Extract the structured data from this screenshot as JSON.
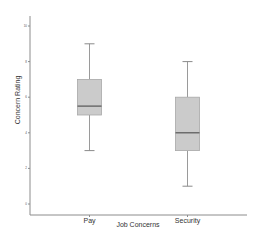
{
  "chart_data": {
    "type": "boxplot",
    "title": "",
    "xlabel": "Job Concerns",
    "ylabel": "Concern Rating",
    "ylim": [
      -0.7,
      10.6
    ],
    "yticks": [
      0,
      2,
      4,
      6,
      8,
      10
    ],
    "ytick_labels": [
      "0",
      "2",
      "4",
      "6",
      "8",
      "10"
    ],
    "grid": false,
    "legend": "none",
    "categories": [
      "Pay",
      "Security"
    ],
    "series": [
      {
        "name": "Pay",
        "whisker_low": 3.0,
        "q1": 5.0,
        "median": 5.5,
        "q3": 7.0,
        "whisker_high": 9.0
      },
      {
        "name": "Security",
        "whisker_low": 1.0,
        "q1": 3.0,
        "median": 4.0,
        "q3": 6.0,
        "whisker_high": 8.0
      }
    ],
    "colors": {
      "box_fill": "#cbcbcb",
      "median_line": "#555555",
      "whisker": "#9a9a9a",
      "axis": "#8c8c8c"
    }
  }
}
